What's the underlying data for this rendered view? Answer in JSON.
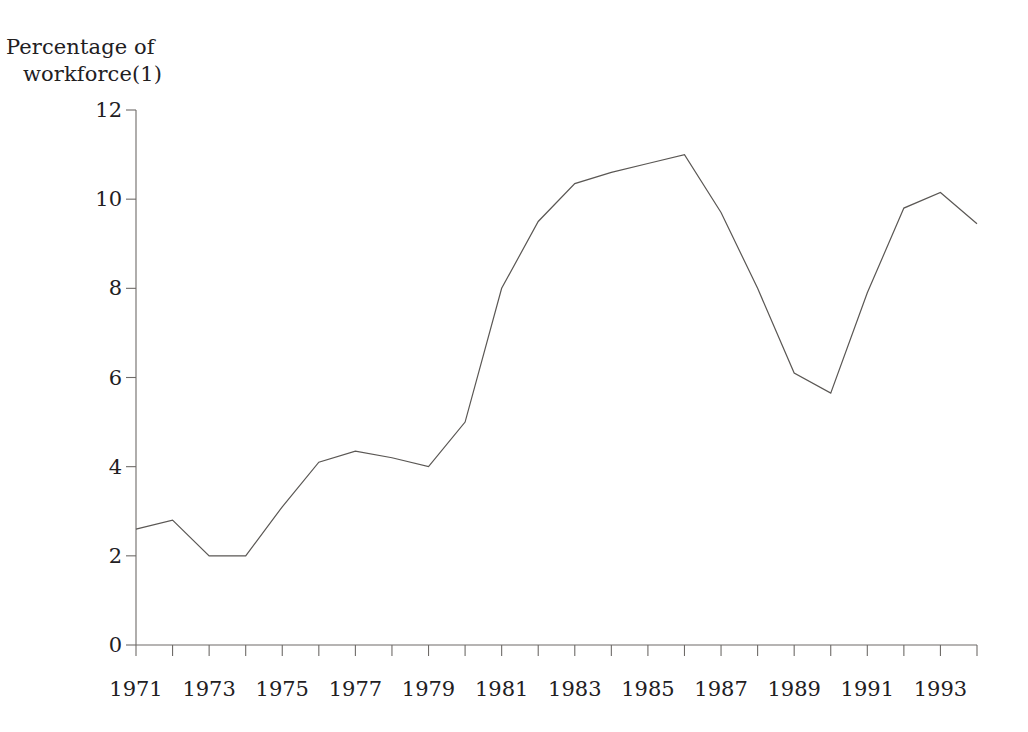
{
  "chart_data": {
    "type": "line",
    "title": "",
    "ylabel": "Percentage of workforce(1)",
    "xlabel": "",
    "ylim": [
      0,
      12
    ],
    "ytick_values": [
      0,
      2,
      4,
      6,
      8,
      10,
      12
    ],
    "ytick_labels": [
      "0",
      "2",
      "4",
      "6",
      "8",
      "10",
      "12"
    ],
    "xlim": [
      1971,
      1994
    ],
    "xtick_values": [
      1971,
      1972,
      1973,
      1974,
      1975,
      1976,
      1977,
      1978,
      1979,
      1980,
      1981,
      1982,
      1983,
      1984,
      1985,
      1986,
      1987,
      1988,
      1989,
      1990,
      1991,
      1992,
      1993,
      1994
    ],
    "xtick_labels_shown": [
      "1971",
      "1973",
      "1975",
      "1977",
      "1979",
      "1981",
      "1983",
      "1985",
      "1987",
      "1989",
      "1991",
      "1993"
    ],
    "grid": false,
    "legend": null,
    "line_color": "#5a5754",
    "series": [
      {
        "name": "Unemployment rate",
        "x": [
          1971,
          1972,
          1973,
          1974,
          1975,
          1976,
          1977,
          1978,
          1979,
          1980,
          1981,
          1982,
          1983,
          1984,
          1985,
          1986,
          1987,
          1988,
          1989,
          1990,
          1991,
          1992,
          1993,
          1994
        ],
        "values": [
          2.6,
          2.8,
          2.0,
          2.0,
          3.1,
          4.1,
          4.35,
          4.2,
          4.0,
          5.0,
          8.0,
          9.5,
          10.35,
          10.6,
          10.8,
          11.0,
          9.7,
          8.0,
          6.1,
          5.65,
          7.9,
          9.8,
          10.15,
          9.45
        ]
      }
    ]
  },
  "axis_label": {
    "line1": "Percentage of",
    "line2": "workforce(1)"
  }
}
